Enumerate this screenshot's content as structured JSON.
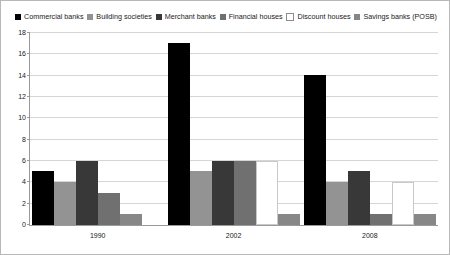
{
  "chart_data": {
    "type": "bar",
    "title": "",
    "xlabel": "",
    "ylabel": "",
    "ylim": [
      0,
      18
    ],
    "ytick_step": 2,
    "yticks": [
      0,
      2,
      4,
      6,
      8,
      10,
      12,
      14,
      16,
      18
    ],
    "grid": true,
    "legend_position": "top",
    "categories": [
      "1990",
      "2002",
      "2008"
    ],
    "series": [
      {
        "name": "Commercial banks",
        "color": "#000000",
        "values": [
          5,
          17,
          14
        ]
      },
      {
        "name": "Building societies",
        "color": "#939393",
        "values": [
          4,
          5,
          4
        ]
      },
      {
        "name": "Merchant banks",
        "color": "#383838",
        "values": [
          6,
          6,
          5
        ]
      },
      {
        "name": "Financial houses",
        "color": "#707070",
        "values": [
          3,
          6,
          1
        ]
      },
      {
        "name": "Discount houses",
        "color": "#ffffff",
        "values": [
          0,
          6,
          4
        ]
      },
      {
        "name": "Savings banks (POSB)",
        "color": "#878787",
        "values": [
          1,
          1,
          1
        ]
      }
    ]
  },
  "legend": {
    "items": [
      {
        "label": "Commercial banks",
        "swatch": "#000000",
        "outlined": false
      },
      {
        "label": "Building societies",
        "swatch": "#939393",
        "outlined": false
      },
      {
        "label": "Merchant banks",
        "swatch": "#383838",
        "outlined": false
      },
      {
        "label": "Financial houses",
        "swatch": "#707070",
        "outlined": false
      },
      {
        "label": "Discount houses",
        "swatch": "#ffffff",
        "outlined": true
      },
      {
        "label": "Savings banks (POSB)",
        "swatch": "#878787",
        "outlined": false
      }
    ]
  }
}
